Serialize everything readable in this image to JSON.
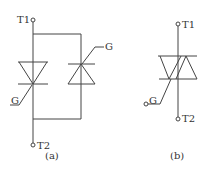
{
  "diagram": {
    "a": {
      "t1": "T1",
      "t2": "T2",
      "gate_left": "G",
      "gate_right": "G",
      "caption": "(a)"
    },
    "b": {
      "t1": "T1",
      "t2": "T2",
      "gate": "G",
      "caption": "(b)"
    },
    "line_color": "#444444"
  }
}
